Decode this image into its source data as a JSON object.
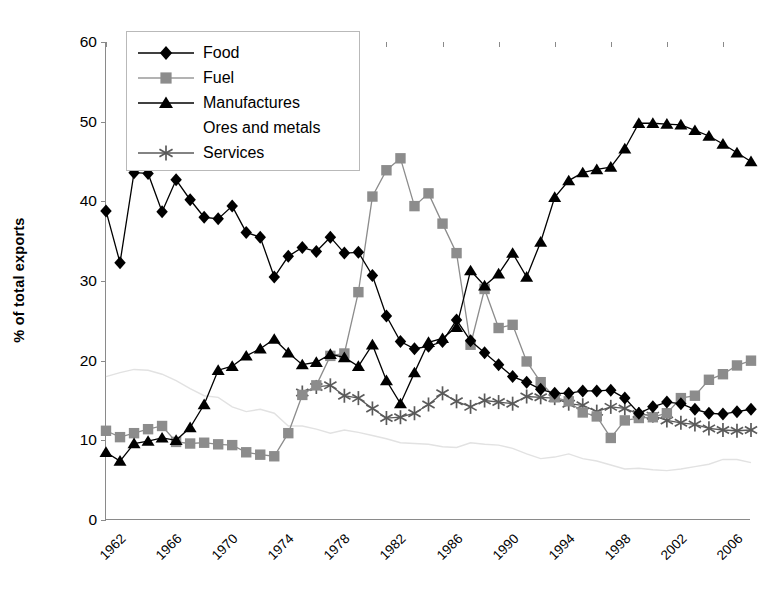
{
  "chart_data": {
    "type": "line",
    "title": "",
    "xlabel": "",
    "ylabel": "% of total exports",
    "ylim": [
      0,
      60
    ],
    "ytick_step": 10,
    "yticks": [
      "0",
      "10",
      "20",
      "30",
      "40",
      "50",
      "60"
    ],
    "xlim": [
      1962,
      2008
    ],
    "xticks": [
      "1962",
      "1966",
      "1970",
      "1974",
      "1978",
      "1982",
      "1986",
      "1990",
      "1994",
      "1998",
      "2002",
      "2006"
    ],
    "grid": false,
    "legend_position": "top-left",
    "x": [
      1962,
      1963,
      1964,
      1965,
      1966,
      1967,
      1968,
      1969,
      1970,
      1971,
      1972,
      1973,
      1974,
      1975,
      1976,
      1977,
      1978,
      1979,
      1980,
      1981,
      1982,
      1983,
      1984,
      1985,
      1986,
      1987,
      1988,
      1989,
      1990,
      1991,
      1992,
      1993,
      1994,
      1995,
      1996,
      1997,
      1998,
      1999,
      2000,
      2001,
      2002,
      2003,
      2004,
      2005,
      2006,
      2007,
      2008
    ],
    "series": [
      {
        "name": "Food",
        "color": "#000000",
        "marker": "diamond",
        "x": [
          1962,
          1963,
          1964,
          1965,
          1966,
          1967,
          1968,
          1969,
          1970,
          1971,
          1972,
          1973,
          1974,
          1975,
          1976,
          1977,
          1978,
          1979,
          1980,
          1981,
          1982,
          1983,
          1984,
          1985,
          1986,
          1987,
          1988,
          1989,
          1990,
          1991,
          1992,
          1993,
          1994,
          1995,
          1996,
          1997,
          1998,
          1999,
          2000,
          2001,
          2002,
          2003,
          2004,
          2005,
          2006,
          2007,
          2008
        ],
        "values": [
          38.8,
          32.3,
          43.6,
          43.5,
          38.7,
          42.7,
          40.2,
          38.0,
          37.8,
          39.4,
          36.1,
          35.5,
          30.5,
          33.1,
          34.2,
          33.7,
          35.5,
          33.5,
          33.6,
          30.7,
          25.6,
          22.4,
          21.5,
          21.8,
          22.4,
          25.1,
          22.5,
          21.0,
          19.5,
          18.0,
          17.3,
          16.4,
          15.9,
          15.9,
          16.2,
          16.2,
          16.3,
          15.3,
          13.4,
          14.2,
          14.8,
          14.6,
          13.9,
          13.4,
          13.3,
          13.6,
          13.9
        ]
      },
      {
        "name": "Fuel",
        "color": "#8c8c8c",
        "marker": "square",
        "x": [
          1962,
          1963,
          1964,
          1965,
          1966,
          1967,
          1968,
          1969,
          1970,
          1971,
          1972,
          1973,
          1974,
          1975,
          1976,
          1977,
          1978,
          1979,
          1980,
          1981,
          1982,
          1983,
          1984,
          1985,
          1986,
          1987,
          1988,
          1989,
          1990,
          1991,
          1992,
          1993,
          1994,
          1995,
          1996,
          1997,
          1998,
          1999,
          2000,
          2001,
          2002,
          2003,
          2004,
          2005,
          2006,
          2007,
          2008
        ],
        "values": [
          11.2,
          10.4,
          10.9,
          11.4,
          11.8,
          9.8,
          9.6,
          9.7,
          9.5,
          9.4,
          8.5,
          8.2,
          8.0,
          10.9,
          15.7,
          16.9,
          20.6,
          20.9,
          28.6,
          40.6,
          43.9,
          45.4,
          39.4,
          41.0,
          37.2,
          33.5,
          22.0,
          29.0,
          24.1,
          24.5,
          19.9,
          17.3,
          15.4,
          14.9,
          13.5,
          13.0,
          10.3,
          12.5,
          12.8,
          12.9,
          13.4,
          15.3,
          15.6,
          17.6,
          18.3,
          19.4,
          20.0
        ]
      },
      {
        "name": "Manufactures",
        "color": "#000000",
        "marker": "triangle",
        "x": [
          1962,
          1963,
          1964,
          1965,
          1966,
          1967,
          1968,
          1969,
          1970,
          1971,
          1972,
          1973,
          1974,
          1975,
          1976,
          1977,
          1978,
          1979,
          1980,
          1981,
          1982,
          1983,
          1984,
          1985,
          1986,
          1987,
          1988,
          1989,
          1990,
          1991,
          1992,
          1993,
          1994,
          1995,
          1996,
          1997,
          1998,
          1999,
          2000,
          2001,
          2002,
          2003,
          2004,
          2005,
          2006,
          2007,
          2008
        ],
        "values": [
          8.5,
          7.4,
          9.6,
          9.9,
          10.3,
          10.0,
          11.6,
          14.5,
          18.8,
          19.3,
          20.6,
          21.5,
          22.7,
          21.0,
          19.5,
          19.8,
          20.8,
          20.4,
          19.3,
          22.0,
          17.5,
          14.6,
          18.5,
          22.3,
          22.8,
          24.2,
          31.3,
          29.4,
          30.9,
          33.5,
          30.5,
          34.9,
          40.5,
          42.6,
          43.6,
          44.0,
          44.3,
          46.6,
          49.8,
          49.8,
          49.7,
          49.6,
          48.9,
          48.2,
          47.2,
          46.1,
          45.0
        ]
      },
      {
        "name": "Ores and metals",
        "color": "#e2e2e2",
        "marker": "none",
        "x": [
          1962,
          1963,
          1964,
          1965,
          1966,
          1967,
          1968,
          1969,
          1970,
          1971,
          1972,
          1973,
          1974,
          1975,
          1976,
          1977,
          1978,
          1979,
          1980,
          1981,
          1982,
          1983,
          1984,
          1985,
          1986,
          1987,
          1988,
          1989,
          1990,
          1991,
          1992,
          1993,
          1994,
          1995,
          1996,
          1997,
          1998,
          1999,
          2000,
          2001,
          2002,
          2003,
          2004,
          2005,
          2006,
          2007,
          2008
        ],
        "values": [
          18.0,
          18.5,
          18.9,
          18.8,
          18.3,
          17.5,
          16.5,
          15.6,
          15.4,
          14.2,
          13.6,
          13.9,
          13.4,
          11.8,
          11.8,
          11.4,
          10.9,
          11.3,
          11.0,
          10.6,
          10.2,
          9.7,
          9.6,
          9.5,
          9.2,
          9.1,
          9.7,
          9.5,
          9.4,
          9.0,
          8.3,
          7.7,
          7.9,
          8.3,
          7.7,
          7.4,
          6.9,
          6.4,
          6.5,
          6.3,
          6.2,
          6.4,
          6.7,
          7.0,
          7.6,
          7.6,
          7.2
        ]
      },
      {
        "name": "Services",
        "color": "#5a5a5a",
        "marker": "asterisk",
        "x": [
          1976,
          1977,
          1978,
          1979,
          1980,
          1981,
          1982,
          1983,
          1984,
          1985,
          1986,
          1987,
          1988,
          1989,
          1990,
          1991,
          1992,
          1993,
          1994,
          1995,
          1996,
          1997,
          1998,
          1999,
          2000,
          2001,
          2002,
          2003,
          2004,
          2005,
          2006,
          2007,
          2008
        ],
        "values": [
          16.0,
          16.7,
          16.9,
          15.6,
          15.3,
          14.0,
          12.8,
          12.9,
          13.4,
          14.5,
          15.9,
          14.9,
          14.2,
          15.0,
          14.8,
          14.6,
          15.5,
          15.4,
          15.3,
          14.6,
          14.4,
          13.6,
          14.2,
          14.0,
          13.3,
          13.1,
          12.5,
          12.2,
          12.0,
          11.5,
          11.3,
          11.2,
          11.3
        ]
      }
    ]
  },
  "legend": {
    "items": [
      {
        "label": "Food",
        "marker": "diamond",
        "color": "#000000",
        "line": "#000000"
      },
      {
        "label": "Fuel",
        "marker": "square",
        "color": "#8c8c8c",
        "line": "#9a9a9a"
      },
      {
        "label": "Manufactures",
        "marker": "triangle",
        "color": "#000000",
        "line": "#000000"
      },
      {
        "label": "Ores and metals",
        "marker": "none",
        "color": "#e8e8e8",
        "line": "#e8e8e8"
      },
      {
        "label": "Services",
        "marker": "asterisk",
        "color": "#5a5a5a",
        "line": "#5a5a5a"
      }
    ]
  }
}
